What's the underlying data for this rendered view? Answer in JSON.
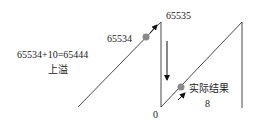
{
  "labels": {
    "overflow_equation": "65534+10=65444",
    "overflow_caption": "上溢",
    "value_before": "65534",
    "value_max": "65535",
    "value_zero": "0",
    "actual_result_caption": "实际结果",
    "actual_result_value": "8"
  },
  "colors": {
    "line": "#333333",
    "dot": "#8a8a8a",
    "text": "#222222"
  }
}
